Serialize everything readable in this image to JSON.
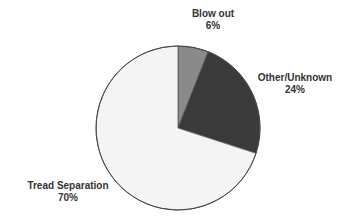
{
  "chart_data": {
    "type": "pie",
    "title": "",
    "start_angle_deg": 0,
    "direction": "clockwise",
    "categories": [
      "Blow out",
      "Other/Unknown",
      "Tread Separation"
    ],
    "values": [
      6,
      24,
      70
    ],
    "value_labels": [
      "6%",
      "24%",
      "70%"
    ],
    "colors": [
      "#8a8a8a",
      "#3a3a3a",
      "#f4f4f4"
    ],
    "stroke": "#555555",
    "legend": "none (data labels next to slices)"
  },
  "labels": {
    "blow_out": {
      "name": "Blow out",
      "pct": "6%"
    },
    "other_unknown": {
      "name": "Other/Unknown",
      "pct": "24%"
    },
    "tread_separation": {
      "name": "Tread Separation",
      "pct": "70%"
    }
  }
}
